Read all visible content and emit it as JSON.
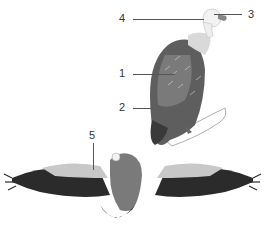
{
  "diagram": {
    "views": [
      "perched-side-view",
      "in-flight-view"
    ],
    "labels": [
      {
        "id": "1",
        "text": "1",
        "points_to": "wing feathers (perched)"
      },
      {
        "id": "2",
        "text": "2",
        "points_to": "tail/lower body (perched)"
      },
      {
        "id": "3",
        "text": "3",
        "points_to": "beak/eye"
      },
      {
        "id": "4",
        "text": "4",
        "points_to": "head/neck"
      },
      {
        "id": "5",
        "text": "5",
        "points_to": "wing coverts (flight)"
      }
    ],
    "colors": {
      "ink": "#333333",
      "dark_feather": "#2b2b2b",
      "mid_feather": "#6e6e6e",
      "light_feather": "#c8c8c8",
      "head": "#f2f2f2"
    }
  }
}
